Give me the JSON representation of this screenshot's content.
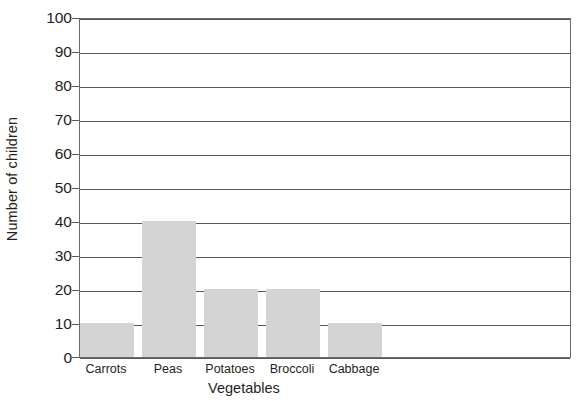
{
  "chart_data": {
    "type": "bar",
    "title": "",
    "xlabel": "Vegetables",
    "ylabel": "Number of children",
    "categories": [
      "Carrots",
      "Peas",
      "Potatoes",
      "Broccoli",
      "Cabbage"
    ],
    "values": [
      10,
      40,
      20,
      20,
      10
    ],
    "ylim": [
      0,
      100
    ],
    "ytick_step": 10,
    "yticks": [
      100,
      90,
      80,
      70,
      60,
      50,
      40,
      30,
      20,
      10,
      0
    ],
    "ytick_labels": [
      "100",
      "90",
      "80",
      "70",
      "60",
      "50",
      "40",
      "30",
      "20",
      "10",
      "0"
    ],
    "grid": "horizontal",
    "legend": "none",
    "bar_color": "#d4d4d4",
    "axis_color": "#58585a",
    "background": "#ffffff"
  },
  "axes": {
    "y_title": "Number of children",
    "x_title": "Vegetables"
  }
}
